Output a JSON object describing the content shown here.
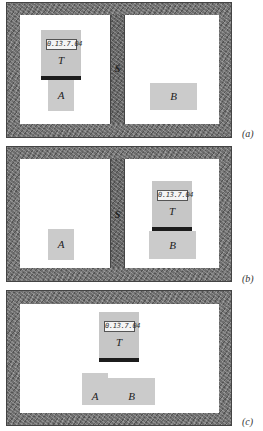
{
  "panels": [
    {
      "id": "a",
      "caption": "(a)",
      "divider_label": "S",
      "thermometer": {
        "label": "T",
        "reading": "0.13.7.04",
        "room": "left"
      },
      "blocks": [
        {
          "label": "A",
          "room": "left",
          "in_contact_with": "T"
        },
        {
          "label": "B",
          "room": "right",
          "in_contact_with": null
        }
      ]
    },
    {
      "id": "b",
      "caption": "(b)",
      "divider_label": "S",
      "thermometer": {
        "label": "T",
        "reading": "0.13.7.04",
        "room": "right"
      },
      "blocks": [
        {
          "label": "A",
          "room": "left",
          "in_contact_with": null
        },
        {
          "label": "B",
          "room": "right",
          "in_contact_with": "T"
        }
      ]
    },
    {
      "id": "c",
      "caption": "(c)",
      "divider_label": null,
      "thermometer": {
        "label": "T",
        "reading": "0.13.7.04",
        "room": "single"
      },
      "blocks": [
        {
          "label": "A",
          "room": "single",
          "in_contact_with": "B"
        },
        {
          "label": "B",
          "room": "single",
          "in_contact_with": "A"
        }
      ]
    }
  ],
  "colors": {
    "wall": "#6e6e6e",
    "room": "#ffffff",
    "block": "#cbcbcb",
    "thermometer_body": "#c6c6c6",
    "thermometer_base": "#1c1c1c"
  }
}
